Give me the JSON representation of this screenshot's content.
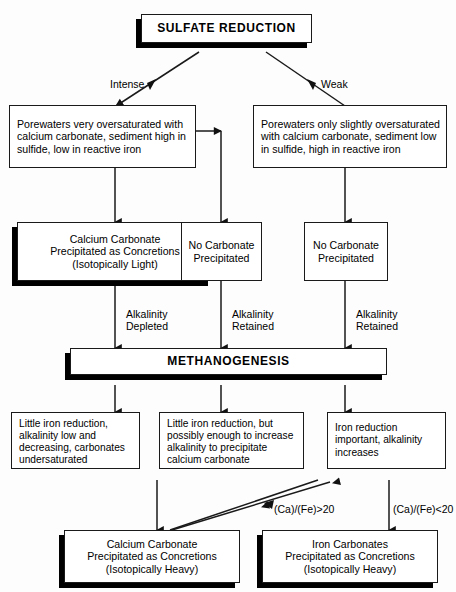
{
  "diagram": {
    "colors": {
      "background": "#fdfdfd",
      "stroke": "#1a1a1a",
      "shadow": "#000000",
      "node_fill": "#ffffff"
    },
    "nodes": {
      "sulfate_reduction": "SULFATE REDUCTION",
      "porewaters_left": "Porewaters very oversaturated with\ncalcium carbonate, sediment high in\nsulfide, low in reactive iron",
      "porewaters_right": "Porewaters only slightly oversaturated\nwith calcium carbonate, sediment low\nin sulfide, high in reactive iron",
      "calcium_carbonate_light": "Calcium Carbonate\nPrecipitated as Concretions\n(Isotopically Light)",
      "no_carbonate_mid": "No Carbonate\nPrecipitated",
      "no_carbonate_right": "No Carbonate\nPrecipitated",
      "methanogenesis": "METHANOGENESIS",
      "little_iron_left": "Little iron reduction,\nalkalinity low and\ndecreasing, carbonates\nundersaturated",
      "little_iron_mid": "Little iron reduction, but\npossibly enough to increase\nalkalinity to  precipitate\ncalcium carbonate",
      "iron_reduction_right": "Iron reduction\nimportant, alkalinity\nincreases",
      "calcium_carbonate_heavy": "Calcium Carbonate\nPrecipitated as Concretions\n(Isotopically Heavy)",
      "iron_carbonates_heavy": "Iron Carbonates\nPrecipitated as Concretions\n(Isotopically Heavy)"
    },
    "edge_labels": {
      "intense": "Intense",
      "weak": "Weak",
      "alkalinity_depleted": "Alkalinity\nDepleted",
      "alkalinity_retained_mid": "Alkalinity\nRetained",
      "alkalinity_retained_right": "Alkalinity\nRetained",
      "ca_fe_greater": "(Ca)/(Fe)>20",
      "ca_fe_less": "(Ca)/(Fe)<20"
    }
  }
}
